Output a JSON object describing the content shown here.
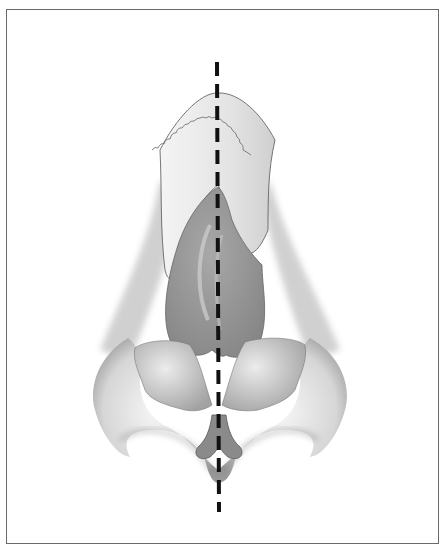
{
  "figure": {
    "structures": [
      "nasal-bones",
      "upper-lateral-cartilage",
      "septum",
      "lower-lateral-cartilage",
      "columella",
      "alar-rim",
      "nostrils"
    ],
    "midline": {
      "style": "dashed",
      "color": "#111111"
    },
    "colors": {
      "border": "#6a6a6a",
      "cartilage": "#8f8f8f",
      "soft_tissue": "#d8d8d8",
      "background": "#ffffff"
    }
  }
}
